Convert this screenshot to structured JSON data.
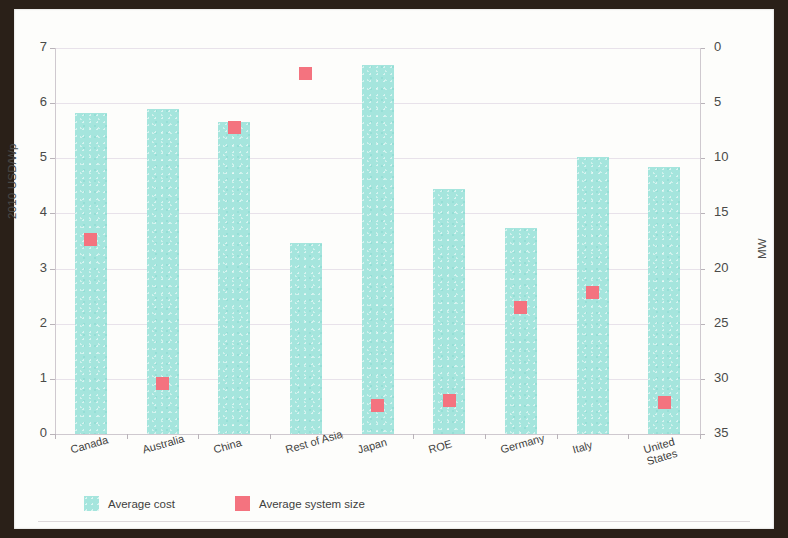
{
  "chart_data": {
    "type": "bar",
    "title": "",
    "categories": [
      "Canada",
      "Australia",
      "China",
      "Rest of Asia",
      "Japan",
      "ROE",
      "Germany",
      "Italy",
      "United States"
    ],
    "series": [
      {
        "name": "Average cost",
        "type": "bar",
        "axis": "left",
        "color": "#a5e5dd",
        "values": [
          5.82,
          5.9,
          5.66,
          3.47,
          6.7,
          4.45,
          3.74,
          5.03,
          4.84
        ]
      },
      {
        "name": "Average system size",
        "type": "scatter",
        "axis": "right",
        "color": "#f4737f",
        "values": [
          17.6,
          4.6,
          27.8,
          32.7,
          2.6,
          3.0,
          11.5,
          12.8,
          2.9
        ]
      }
    ],
    "xlabel": "",
    "ylabel": "2010 USD/Wp",
    "y2label": "MW",
    "ylim": [
      0,
      7
    ],
    "y2lim": [
      0,
      35
    ],
    "yticks": [
      "0",
      "1",
      "2",
      "3",
      "4",
      "5",
      "6",
      "7"
    ],
    "y2ticks": [
      "0",
      "5",
      "10",
      "15",
      "20",
      "25",
      "30",
      "35"
    ],
    "grid": true,
    "legend_position": "bottom-left"
  },
  "axes": {
    "left_title": "2010 USD/Wp",
    "right_title": "MW",
    "left_ticks": [
      "7",
      "6",
      "5",
      "4",
      "3",
      "2",
      "1",
      "0"
    ],
    "right_ticks": [
      "35",
      "30",
      "25",
      "20",
      "15",
      "10",
      "5",
      "0"
    ]
  },
  "categories": [
    {
      "label": "Canada",
      "lines": [
        "Canada"
      ]
    },
    {
      "label": "Australia",
      "lines": [
        "Australia"
      ]
    },
    {
      "label": "China",
      "lines": [
        "China"
      ]
    },
    {
      "label": "Rest of Asia",
      "lines": [
        "Rest of Asia"
      ]
    },
    {
      "label": "Japan",
      "lines": [
        "Japan"
      ]
    },
    {
      "label": "ROE",
      "lines": [
        "ROE"
      ]
    },
    {
      "label": "Germany",
      "lines": [
        "Germany"
      ]
    },
    {
      "label": "Italy",
      "lines": [
        "Italy"
      ]
    },
    {
      "label": "United States",
      "lines": [
        "United",
        "States"
      ]
    }
  ],
  "legend": {
    "items": [
      {
        "label": "Average cost",
        "swatch": "cost",
        "color": "#a5e5dd"
      },
      {
        "label": "Average system size",
        "swatch": "size",
        "color": "#f4737f"
      }
    ]
  }
}
